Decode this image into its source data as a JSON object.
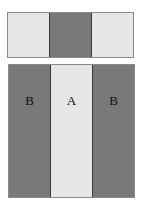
{
  "colors": {
    "light": "#e6e6e6",
    "dark": "#797979",
    "divider": "#3a3a3a"
  },
  "top_strip": {
    "panels": [
      {
        "shade": "light",
        "label": ""
      },
      {
        "shade": "dark",
        "label": ""
      },
      {
        "shade": "light",
        "label": ""
      }
    ]
  },
  "bottom_strip": {
    "panels": [
      {
        "shade": "dark",
        "label": "B"
      },
      {
        "shade": "light",
        "label": "A"
      },
      {
        "shade": "dark",
        "label": "B"
      }
    ]
  }
}
